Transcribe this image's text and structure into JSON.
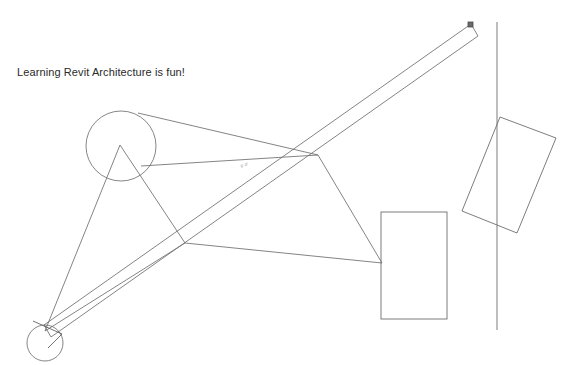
{
  "canvas": {
    "width": 579,
    "height": 365,
    "background": "#ffffff",
    "line_color": "#6e6e6e",
    "line_color_dark": "#4a4a4a",
    "text_color": "#2a2a2a"
  },
  "annotations": {
    "note": "Learning Revit Architecture is fun!",
    "dimension_label": "8' 4\"",
    "ghost_header": ""
  },
  "geometry": {
    "large_circle": {
      "name": "large-circle",
      "cx": 121,
      "cy": 146,
      "r": 35
    },
    "small_circle": {
      "name": "small-circle",
      "cx": 45,
      "cy": 343,
      "r": 18
    },
    "triangle_left": {
      "name": "triangle-left",
      "points": "120,145 45,331 185,243"
    },
    "triangle_right": {
      "name": "triangle-right",
      "points": "138,113 318,155 382,263"
    },
    "connector_apex_to_right": {
      "name": "connector-apex-to-right",
      "x1": 318,
      "y1": 155,
      "x2": 382,
      "y2": 263
    },
    "connector_base_to_right": {
      "name": "connector-base-to-right",
      "x1": 185,
      "y1": 243,
      "x2": 382,
      "y2": 263
    },
    "connector_circle_to_apex": {
      "name": "connector-circle-to-apex",
      "x1": 138,
      "y1": 113,
      "x2": 318,
      "y2": 155
    },
    "connector_mid_chord": {
      "name": "connector-mid-chord",
      "x1": 141,
      "y1": 166,
      "x2": 318,
      "y2": 155
    },
    "wall_band": {
      "name": "wall-band",
      "outer": "471,24 478,36 51,337 44,325",
      "edge_a": {
        "x1": 471,
        "y1": 24,
        "x2": 44,
        "y2": 325
      },
      "edge_b": {
        "x1": 478,
        "y1": 36,
        "x2": 51,
        "y2": 337
      },
      "cap_top": {
        "x1": 471,
        "y1": 24,
        "x2": 478,
        "y2": 36
      },
      "cap_bottom": {
        "x1": 44,
        "y1": 325,
        "x2": 51,
        "y2": 337
      }
    },
    "wall_endpoint_marker": {
      "name": "wall-endpoint-marker",
      "x": 468,
      "y": 22,
      "w": 5,
      "h": 5
    },
    "wall_arrow": {
      "name": "wall-direction-arrow",
      "points": "33,321 62,334 48,348"
    },
    "vertical_line": {
      "name": "vertical-reference-line",
      "x1": 497,
      "y1": 22,
      "x2": 497,
      "y2": 330
    },
    "rect_upright": {
      "name": "rectangle-upright",
      "x": 381,
      "y": 212,
      "w": 66,
      "h": 107
    },
    "rect_rotated": {
      "name": "rectangle-rotated",
      "points": "500,117 556,138 517,233 462,211"
    }
  }
}
